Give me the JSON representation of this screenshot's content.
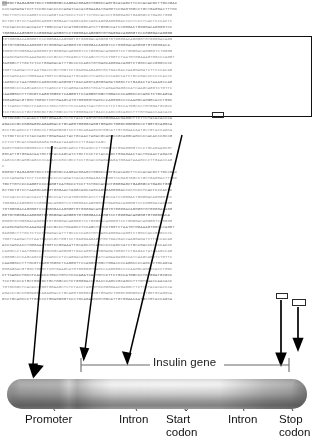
{
  "figure": {
    "type": "gene-structure-diagram",
    "title": "Insulin gene",
    "gene_label": "Insulin gene",
    "colors": {
      "sequence_text": "#9a9a9a",
      "box_outline": "#101010",
      "arrow": "#000000",
      "label_text": "#121212",
      "bracket": "#5a5a5a",
      "cylinder_light": "#f4f4f4",
      "cylinder_dark": "#848484"
    }
  },
  "sequence": {
    "lines": [
      "GGGGCTGAGAGGGTGCCTGGGGGGCCAGGACGGAGCTGGGCCAGTGCACAGCTTCCCACACGCTTGCCGAC",
      "CCCCAGAGATCCTTCCGCCACCCCCAGATCACACGGAAGATGAGGTCCGAGTGGCCTGCTGAGGACTTTGC",
      "TGCTTGTCCCCAGGTCCCCAGGTCATGCCCTCCTTCTGCCACCCTGGGGAGCTGAGGGCCTGAGCTGGG",
      "GCTGCTGTCCTAAGGCAGGGTGGGAACTAGGCAGCCAGCAGGGAGGGGACCCCTCCCTCACTCCCACTC",
      "TCCCACCCCCACCACCTTGGCCCATCCATGGCGGCATCTTGGGCCATCCGGGACTGGGGACAGGGGTCC",
      "TGGGGACAGGGGTCCGGGGACAGGGTCCTGGGGACAGGGGTGTGAGGACAGGGGTCCCGGGGACAGGGG",
      "TGTGGGGACAGGGGTCCCGGGGACAGGGGTGTGGGGACAGGGGTGTGGGGACAGGGGTGTGGGGACAGG",
      "GGTGTGGGGACAGGGGTGTGGGGACAGGGGTGTGGGGACAGGGTCCTGGGGACAGGGGTGTGGGGACA",
      "GGGGTGTGGGGACAGGGGTGTGGGGACAGGGGTCCTGGGGACAGGGGTCCTGGGGACAGGGGTCTGGGG",
      "ACAGCGAGCGCAAAGAGCCCCGCCCTGCAGCCTCCAGCTCTCCTGGTCTAATGTGGAAAGTGGCCCAGGT",
      "GAGGGCTTTGCTCTCCTGGAGACATTTGCCCCCAGCTGTGAGCAGGGACAGGTCTGGCCACCGGGCCCC",
      "TGGTTAAGACTCTAATGACCCGCTGGTCCTGAGGAAGAGGTGCTGACGACCAAGGAGATCTTCCCACAG",
      "ACCCAGCACCTGGGAAATGGTCCGGAAATTGCAGCCTCAGCCCCCAGCCATCTGCCGACCCCCCCACCC",
      "CAGGCCCTAATGGGCCAGGCGGCAGGGGTTGACAGGTAGGGGAGATGGGCTCTGAGACTATAAAGCCAG",
      "CGGGGCCCCAGCAGCCCTCAGCCCTCCAGGACAGGCTGCATCAGAAGAGGCCATCAAGCAGGTCTGTTC",
      "CAAGGGCCTTTGCGTCAGGTGGGCTCAGGGTTCCAGGGTGGCTGGACCCCAGGCCCCAGCTCTGCAGCA",
      "GGGAGGACGTGGCTGGGCTCGTGAAGCATGTGGGGGTGAGCCCAGGGGCCCCAAGGCAGGGCACCTGGC",
      "CTTCAGCCTGCCTCAGCCCTGCCTGTCTCCCAGATCACTGTCCTTCTGCCATGGCCCTGTGGATGCGCC",
      "TCCTGCCCCTGCTGGCGCTGCTGGCCCTCTGGGGACCTGACCCAGCCGCAGCCTTTGTGAACCAACACC",
      "TGTGCGGCTCACACCTGGTGGAAGCTCTCTACCTAGTGTGCGGGGAACGAGGCTTCTTCTACACACCCA",
      "AGACCCGCCGGGAGGCAGAGGACCTGCAGGTGGGGCAGGTGGAGCTGGGCGGGGGCCCTGGTGCAGGCA",
      "GCCTGCAGCCCTTGGCCCTGGAGGGGTCCCTGCAGAAGCGTGGCATTGTGGAACAATGCTGTACCAGCA",
      "TCTGCTCCCTCTACCAGCTGGAGAACTACTGCAACTAGACGCAGCCCGCAGGCAGCCCCACACCCGCCG",
      "CCTCCTGCACCGAGAGAGATGGAATAAAGCCCTTGAACCAGC",
      "GAGCTGGGCGGGGGCCCTGGTGCAGGCAGCCTGCAGCCCTTGGCCCTGGAGGGGTCCCTGCAGAAGCGT",
      "GGCATTGTGGAACAATGCTGTACCAGCATCTGCTCCCTCTACCAGCTGGAGAACTACTGCAACTAGACG",
      "CAGCCCGCAGGCAGCCCCACACCCGCCGCCTCCTGCACCGAGAGAGATGGAATAAAGCCCTTGAACCAG",
      "C"
    ]
  },
  "annotations": {
    "gene_bracket_label": "Insulin gene",
    "boxed_regions": [
      {
        "name": "promoter-region-box"
      },
      {
        "name": "start-codon-box"
      },
      {
        "name": "stop-codon-box-1"
      },
      {
        "name": "stop-codon-box-2"
      }
    ]
  },
  "labels": [
    {
      "id": "promoter",
      "line1": "Promoter",
      "line2": ""
    },
    {
      "id": "intron-1",
      "line1": "Intron",
      "line2": ""
    },
    {
      "id": "start-codon",
      "line1": "Start",
      "line2": "codon"
    },
    {
      "id": "intron-2",
      "line1": "Intron",
      "line2": ""
    },
    {
      "id": "stop-codon",
      "line1": "Stop",
      "line2": "codon"
    }
  ]
}
